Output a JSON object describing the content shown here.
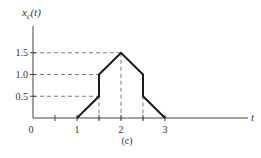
{
  "chart_data": {
    "type": "line",
    "title": "",
    "ylabel": "x_c(t)",
    "ylabel_main": "x",
    "ylabel_sub": "c",
    "ylabel_arg": "(t)",
    "xlabel": "t",
    "caption": "(c)",
    "origin_label": "0",
    "x_ticks": [
      {
        "value": 0.5,
        "label": ""
      },
      {
        "value": 1,
        "label": "1"
      },
      {
        "value": 1.5,
        "label": ""
      },
      {
        "value": 2,
        "label": "2"
      },
      {
        "value": 2.5,
        "label": ""
      },
      {
        "value": 3,
        "label": "3"
      }
    ],
    "y_ticks": [
      {
        "value": 0.5,
        "label": "0.5"
      },
      {
        "value": 1.0,
        "label": "1.0"
      },
      {
        "value": 1.5,
        "label": "1.5"
      }
    ],
    "xlim": [
      0,
      4.4
    ],
    "ylim": [
      0,
      2.0
    ],
    "grid": false,
    "legend": null,
    "series": [
      {
        "name": "x_c(t)",
        "points": [
          [
            1,
            0
          ],
          [
            1.5,
            0.5
          ],
          [
            1.5,
            1.0
          ],
          [
            2,
            1.5
          ],
          [
            2.5,
            1.0
          ],
          [
            2.5,
            0.5
          ],
          [
            3,
            0
          ]
        ]
      }
    ],
    "guides": {
      "horizontal": [
        {
          "y": 0.5,
          "x_end": 1.5
        },
        {
          "y": 1.0,
          "x_end": 1.5
        },
        {
          "y": 1.5,
          "x_end": 2
        }
      ],
      "vertical": [
        {
          "x": 1.5,
          "y_end": 1.0
        },
        {
          "x": 2,
          "y_end": 1.5
        },
        {
          "x": 2.5,
          "y_end": 1.0
        }
      ]
    },
    "colors": {
      "curve": "#1a1a1a",
      "axis": "#444444",
      "guide": "#555555",
      "text": "#333333"
    }
  }
}
